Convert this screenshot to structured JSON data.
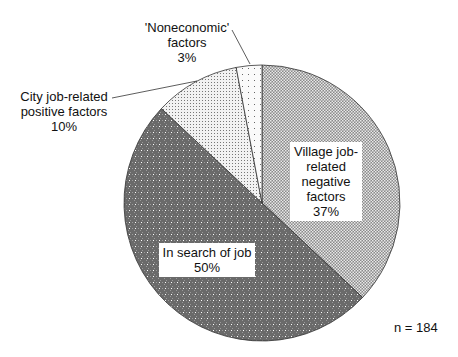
{
  "chart_data": {
    "type": "pie",
    "title": "",
    "slices": [
      {
        "label": "Village job-related negative factors",
        "value": 37,
        "pattern": "dense-checker"
      },
      {
        "label": "In search of job",
        "value": 50,
        "pattern": "dark-dotted"
      },
      {
        "label": "City job-related positive factors",
        "value": 10,
        "pattern": "light-dots"
      },
      {
        "label": "'Noneconomic' factors",
        "value": 3,
        "pattern": "sparse-dots"
      }
    ],
    "note": "n = 184",
    "start_angle": "12 o'clock",
    "direction": "clockwise"
  },
  "labels": {
    "village": {
      "l1": "Village job-",
      "l2": "related",
      "l3": "negative",
      "l4": "factors",
      "pct": "37%"
    },
    "search": {
      "l1": "In search of job",
      "pct": "50%"
    },
    "city": {
      "l1": "City job-related",
      "l2": "positive factors",
      "pct": "10%"
    },
    "noneco": {
      "l1": "'Noneconomic'",
      "l2": "factors",
      "pct": "3%"
    },
    "n": "n = 184"
  }
}
